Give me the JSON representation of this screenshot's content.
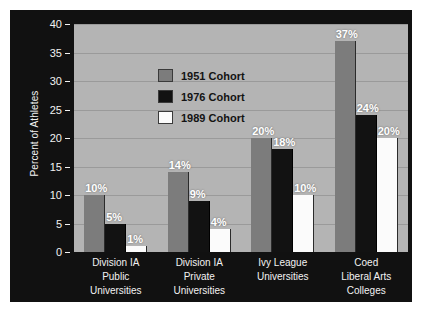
{
  "chart_data": {
    "type": "bar",
    "title": "",
    "xlabel": "",
    "ylabel": "Percent of Athletes",
    "ylim": [
      0,
      40
    ],
    "yticks": [
      0,
      5,
      10,
      15,
      20,
      25,
      30,
      35,
      40
    ],
    "grid": true,
    "legend_position": "top-left inside plot",
    "categories": [
      "Division IA Public Universities",
      "Division IA Private Universities",
      "Ivy League Universities",
      "Coed Liberal Arts Colleges"
    ],
    "category_lines": [
      [
        "Division IA",
        "Public",
        "Universities"
      ],
      [
        "Division IA",
        "Private",
        "Universities"
      ],
      [
        "Ivy League",
        "Universities"
      ],
      [
        "Coed",
        "Liberal Arts",
        "Colleges"
      ]
    ],
    "series": [
      {
        "name": "1951 Cohort",
        "color": "#7c7c7c",
        "values": [
          10,
          14,
          20,
          37
        ],
        "labels": [
          "10%",
          "14%",
          "20%",
          "37%"
        ]
      },
      {
        "name": "1976 Cohort",
        "color": "#121212",
        "values": [
          5,
          9,
          18,
          24
        ],
        "labels": [
          "5%",
          "9%",
          "18%",
          "24%"
        ]
      },
      {
        "name": "1989 Cohort",
        "color": "#fbfbfb",
        "values": [
          1,
          4,
          10,
          20
        ],
        "labels": [
          "1%",
          "4%",
          "10%",
          "20%"
        ]
      }
    ]
  },
  "colors": {
    "frame_background": "#111111",
    "plot_background": "#b4b4b4",
    "gridline": "#9a9a9a",
    "axis_text": "#f2f2f2",
    "legend_text": "#131313",
    "bar_label_text": "#ffffff"
  }
}
